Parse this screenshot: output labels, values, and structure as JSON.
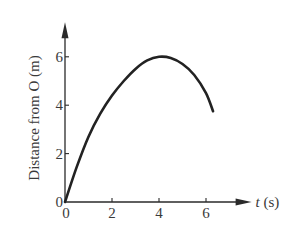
{
  "chart_data": {
    "type": "line",
    "title": "",
    "xlabel_var": "t",
    "xlabel_unit": " (s)",
    "ylabel": "Distance from O (m)",
    "xlim": [
      0,
      7.6
    ],
    "ylim": [
      0,
      7.1
    ],
    "x_ticks": [
      0,
      2,
      4,
      6
    ],
    "x_tick_labels": [
      "0",
      "2",
      "4",
      "6"
    ],
    "y_ticks": [
      0,
      2,
      4,
      6
    ],
    "y_tick_labels": [
      "0",
      "2",
      "4",
      "6"
    ],
    "grid": false,
    "legend": "none",
    "series": [
      {
        "name": "distance",
        "x": [
          0,
          0.5,
          1,
          1.5,
          2,
          2.5,
          3,
          3.5,
          4,
          4.5,
          5,
          5.5,
          6,
          6.3
        ],
        "y": [
          0,
          1.45,
          2.7,
          3.65,
          4.4,
          5.0,
          5.5,
          5.85,
          6.0,
          5.95,
          5.7,
          5.25,
          4.5,
          3.75
        ]
      }
    ]
  }
}
